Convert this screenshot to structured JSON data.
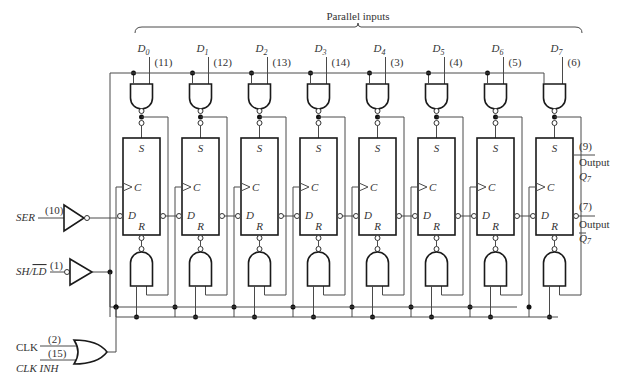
{
  "title": "Parallel inputs",
  "parallel_inputs": [
    {
      "name": "D",
      "sub": "0",
      "pin": "(11)"
    },
    {
      "name": "D",
      "sub": "1",
      "pin": "(12)"
    },
    {
      "name": "D",
      "sub": "2",
      "pin": "(13)"
    },
    {
      "name": "D",
      "sub": "3",
      "pin": "(14)"
    },
    {
      "name": "D",
      "sub": "4",
      "pin": "(3)"
    },
    {
      "name": "D",
      "sub": "5",
      "pin": "(4)"
    },
    {
      "name": "D",
      "sub": "6",
      "pin": "(5)"
    },
    {
      "name": "D",
      "sub": "7",
      "pin": "(6)"
    }
  ],
  "flipflop_labels": {
    "set": "S",
    "clock": "C",
    "data": "D",
    "reset": "R"
  },
  "inputs": {
    "ser": {
      "label": "SER",
      "pin": "(10)"
    },
    "shld": {
      "label": "SH/LD",
      "pin": "(1)"
    },
    "clk": {
      "label": "CLK",
      "pin": "(2)"
    },
    "clkinh": {
      "label": "CLK INH",
      "pin": "(15)"
    }
  },
  "outputs": {
    "q7": {
      "pin": "(9)",
      "label": "Output",
      "signal": "Q",
      "sub": "7"
    },
    "q7bar": {
      "pin": "(7)",
      "label": "Output",
      "signal": "Q",
      "sub": "7",
      "inverted": true
    }
  }
}
